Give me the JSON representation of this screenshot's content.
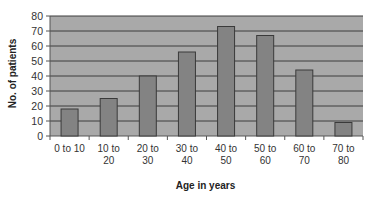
{
  "chart_data": {
    "type": "bar",
    "title": "",
    "xlabel": "Age in years",
    "ylabel": "No. of patients",
    "categories": [
      "0 to 10",
      "10 to 20",
      "20 to 30",
      "30 to 40",
      "40 to 50",
      "50 to 60",
      "60 to 70",
      "70 to 80"
    ],
    "category_lines": [
      [
        "0 to 10"
      ],
      [
        "10 to",
        "20"
      ],
      [
        "20 to",
        "30"
      ],
      [
        "30 to",
        "40"
      ],
      [
        "40 to",
        "50"
      ],
      [
        "50 to",
        "60"
      ],
      [
        "60 to",
        "70"
      ],
      [
        "70 to",
        "80"
      ]
    ],
    "values": [
      18,
      25,
      40,
      56,
      73,
      67,
      44,
      9
    ],
    "ylim": [
      0,
      80
    ],
    "yticks": [
      0,
      10,
      20,
      30,
      40,
      50,
      60,
      70,
      80
    ],
    "grid": true,
    "legend": null
  },
  "colors": {
    "plot_background": "#a9a9a9",
    "bar_fill": "#838383",
    "bar_stroke": "#3a3a3a",
    "gridline": "#3c3c3c",
    "axis": "#555555"
  }
}
